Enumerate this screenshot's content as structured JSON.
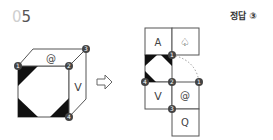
{
  "question": {
    "number_prefix": "0",
    "number": "5"
  },
  "answer": {
    "label": "정답",
    "value": "③"
  },
  "cube": {
    "top_face": "@",
    "right_face": "V",
    "vertex_labels": [
      "1",
      "2",
      "3",
      "4"
    ]
  },
  "arrow": "⇨",
  "net": {
    "faces": [
      {
        "id": "A",
        "label": "A"
      },
      {
        "id": "spade",
        "label": "♤"
      },
      {
        "id": "pattern",
        "label": ""
      },
      {
        "id": "V",
        "label": "V"
      },
      {
        "id": "at",
        "label": "@"
      },
      {
        "id": "Q",
        "label": "Q"
      }
    ],
    "vertex_labels": [
      "1",
      "2",
      "1",
      "4",
      "3"
    ]
  },
  "colors": {
    "line": "#555555",
    "fill": "#111111",
    "badge": "#444444"
  }
}
